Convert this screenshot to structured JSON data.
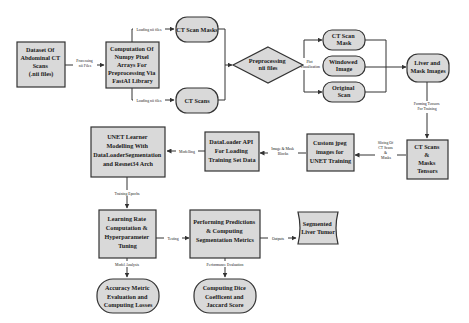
{
  "diagram": {
    "colors": {
      "node_fill": "#d9d9d9",
      "stroke": "#333333",
      "text": "#1a1a1a",
      "background": "#ffffff"
    },
    "nodes": {
      "dataset": {
        "shape": "rectangle",
        "lines": [
          "Dataset Of",
          "Abdominal CT",
          "Scans",
          "(.nii files)"
        ]
      },
      "computation": {
        "shape": "rectangle",
        "lines": [
          "Computation Of",
          "Numpy Pixel",
          "Arrays For",
          "Preprocessing Via",
          "FastAI Library"
        ]
      },
      "ct_scan_masks": {
        "shape": "rounded",
        "lines": [
          "CT Scan Masks"
        ]
      },
      "ct_scans": {
        "shape": "rounded",
        "lines": [
          "CT Scans"
        ]
      },
      "preprocessing": {
        "shape": "diamond",
        "lines": [
          "Preprocessing",
          "nii files"
        ]
      },
      "ct_scan_mask": {
        "shape": "rounded",
        "lines": [
          "CT Scan",
          "Mask"
        ]
      },
      "windowed_image": {
        "shape": "rounded",
        "lines": [
          "Windowed",
          "Image"
        ]
      },
      "original_scan": {
        "shape": "rounded",
        "lines": [
          "Original",
          "Scan"
        ]
      },
      "liver_mask_images": {
        "shape": "rounded",
        "lines": [
          "Liver and",
          "Mask Images"
        ]
      },
      "ct_masks_tensors": {
        "shape": "rectangle",
        "lines": [
          "CT Scans",
          "&",
          "Masks",
          "Tensors"
        ]
      },
      "custom_jpeg": {
        "shape": "rectangle",
        "lines": [
          "Custom jpeg",
          "images for",
          "UNET Training"
        ]
      },
      "dataloader_api": {
        "shape": "rectangle",
        "lines": [
          "DataLoader API",
          "For Loading",
          "Training Set Data"
        ]
      },
      "unet_learner": {
        "shape": "rectangle",
        "lines": [
          "UNET Learner",
          "Modelling With",
          "DataLoaderSegmentation",
          "and Resnet34 Arch"
        ]
      },
      "learning_rate": {
        "shape": "rectangle",
        "lines": [
          "Learning Rate",
          "Computation &",
          "Hyperparameter",
          "Tuning"
        ]
      },
      "predictions": {
        "shape": "rectangle",
        "lines": [
          "Performing Predictions",
          "& Computing",
          "Segmentation Metrics"
        ]
      },
      "segmented_tumor": {
        "shape": "document",
        "lines": [
          "Segmented",
          "Liver Tumor"
        ]
      },
      "accuracy_metric": {
        "shape": "rounded",
        "lines": [
          "Accuracy Metric",
          "Evaluation and",
          "Computing Losses"
        ]
      },
      "dice_jaccard": {
        "shape": "rounded",
        "lines": [
          "Computing Dice",
          "Coefficent and",
          "Jaccard Score"
        ]
      }
    },
    "edges": {
      "dataset_to_computation": {
        "lines": [
          "Processing",
          "nii Files"
        ]
      },
      "computation_to_masks": {
        "lines": [
          "Loading nii files"
        ]
      },
      "computation_to_scans": {
        "lines": [
          "Loading nii files"
        ]
      },
      "preprocessing_to_views": {
        "lines": [
          "Plot",
          "Visualization"
        ]
      },
      "liver_to_tensors": {
        "lines": [
          "Forming Tensors",
          "For Training"
        ]
      },
      "tensors_to_jpeg": {
        "lines": [
          "Slicing Of",
          "CT Scans",
          "&",
          "Masks"
        ]
      },
      "jpeg_to_dataloader": {
        "lines": [
          "Image & Mask",
          "Blocks"
        ]
      },
      "dataloader_to_unet": {
        "lines": [
          "Modelling"
        ]
      },
      "unet_to_lr": {
        "lines": [
          "Training Epochs"
        ]
      },
      "lr_to_predictions": {
        "lines": [
          "Testing"
        ]
      },
      "predictions_to_tumor": {
        "lines": [
          "Outputs"
        ]
      },
      "lr_to_accuracy": {
        "lines": [
          "Model Analysis"
        ]
      },
      "predictions_to_dice": {
        "lines": [
          "Performance Evaluation"
        ]
      }
    }
  }
}
